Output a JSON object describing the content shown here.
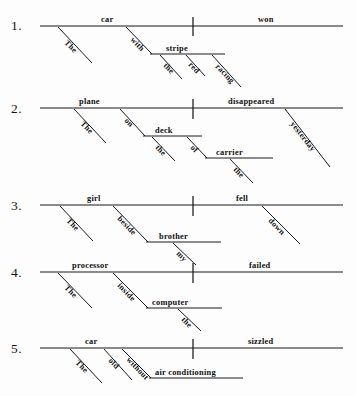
{
  "page": {
    "background": "#fdfdfd",
    "ink": "#111111",
    "width": 357,
    "height": 396
  },
  "diagrams": [
    {
      "number": "1.",
      "sentence": "The car with the red racing stripe won.",
      "subject": "car",
      "predicate": "won",
      "words": {
        "subject": "car",
        "verb": "won",
        "subject_article": "The",
        "preposition": "with",
        "prep_object": "stripe",
        "prep_object_article": "the",
        "prep_object_mod1": "red",
        "prep_object_mod2": "racing"
      }
    },
    {
      "number": "2.",
      "sentence": "The plane on the deck of the carrier disappeared yesterday.",
      "subject": "plane",
      "predicate": "disappeared",
      "words": {
        "subject": "plane",
        "verb": "disappeared",
        "subject_article": "The",
        "preposition1": "on",
        "prep_object1": "deck",
        "prep_object1_article": "the",
        "preposition2": "of",
        "prep_object2": "carrier",
        "prep_object2_article": "the",
        "adverb": "yesterday"
      }
    },
    {
      "number": "3.",
      "sentence": "The girl beside my brother fell down.",
      "subject": "girl",
      "predicate": "fell",
      "words": {
        "subject": "girl",
        "verb": "fell",
        "subject_article": "The",
        "preposition": "beside",
        "prep_object": "brother",
        "prep_object_mod": "my",
        "adverb": "down"
      }
    },
    {
      "number": "4.",
      "sentence": "The processor inside the computer failed.",
      "subject": "processor",
      "predicate": "failed",
      "words": {
        "subject": "processor",
        "verb": "failed",
        "subject_article": "The",
        "preposition": "inside",
        "prep_object": "computer",
        "prep_object_article": "the"
      }
    },
    {
      "number": "5.",
      "sentence": "The old car without air conditioning sizzled.",
      "subject": "car",
      "predicate": "sizzled",
      "words": {
        "subject": "car",
        "verb": "sizzled",
        "subject_article": "The",
        "subject_mod": "old",
        "preposition": "without",
        "prep_object": "air conditioning"
      }
    }
  ]
}
